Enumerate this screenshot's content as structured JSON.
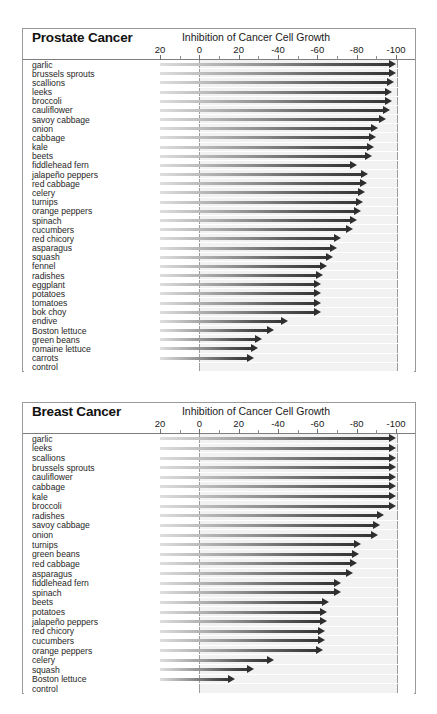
{
  "chart_data": [
    {
      "type": "bar",
      "title": "Prostate Cancer",
      "subtitle": "Inhibition of Cancer Cell Growth",
      "xlabel": "Inhibition of Cancer Cell Growth",
      "ylabel": "",
      "orientation": "horizontal",
      "grid": false,
      "legend": "none",
      "axis_ticks": [
        "20",
        "0",
        "20",
        "-40",
        "-60",
        "-80",
        "-100"
      ],
      "axis_tick_values": [
        20,
        0,
        -20,
        -40,
        -60,
        -80,
        -100
      ],
      "xlim": [
        20,
        -100
      ],
      "categories": [
        "garlic",
        "brussels sprouts",
        "scallions",
        "leeks",
        "broccoli",
        "cauliflower",
        "savoy cabbage",
        "onion",
        "cabbage",
        "kale",
        "beets",
        "fiddlehead fern",
        "jalapeño peppers",
        "red cabbage",
        "celery",
        "turnips",
        "orange peppers",
        "spinach",
        "cucumbers",
        "red chicory",
        "asparagus",
        "squash",
        "fennel",
        "radishes",
        "eggplant",
        "potatoes",
        "tomatoes",
        "bok choy",
        "endive",
        "Boston lettuce",
        "green beans",
        "romaine lettuce",
        "carrots",
        "control"
      ],
      "values": [
        -100,
        -100,
        -99,
        -98,
        -98,
        -97,
        -95,
        -91,
        -90,
        -89,
        -88,
        -80,
        -86,
        -85,
        -84,
        -83,
        -82,
        -80,
        -78,
        -72,
        -70,
        -68,
        -65,
        -63,
        -62,
        -62,
        -62,
        -62,
        -45,
        -38,
        -32,
        -30,
        -28,
        0
      ]
    },
    {
      "type": "bar",
      "title": "Breast Cancer",
      "subtitle": "Inhibition of Cancer Cell Growth",
      "xlabel": "Inhibition of Cancer Cell Growth",
      "ylabel": "",
      "orientation": "horizontal",
      "grid": false,
      "legend": "none",
      "axis_ticks": [
        "20",
        "0",
        "20",
        "-40",
        "-60",
        "-80",
        "-100"
      ],
      "axis_tick_values": [
        20,
        0,
        -20,
        -40,
        -60,
        -80,
        -100
      ],
      "xlim": [
        20,
        -100
      ],
      "categories": [
        "garlic",
        "leeks",
        "scallions",
        "brussels sprouts",
        "cauliflower",
        "cabbage",
        "kale",
        "broccoli",
        "radishes",
        "savoy cabbage",
        "onion",
        "turnips",
        "green beans",
        "red cabbage",
        "asparagus",
        "fiddlehead fern",
        "spinach",
        "beets",
        "potatoes",
        "jalapeño peppers",
        "red chicory",
        "cucumbers",
        "orange peppers",
        "celery",
        "squash",
        "Boston lettuce",
        "control"
      ],
      "values": [
        -100,
        -100,
        -100,
        -100,
        -100,
        -100,
        -100,
        -100,
        -94,
        -92,
        -91,
        -82,
        -81,
        -80,
        -78,
        -72,
        -72,
        -66,
        -65,
        -65,
        -64,
        -64,
        -63,
        -38,
        -28,
        -18,
        0
      ]
    }
  ],
  "panels": [
    {
      "id": "prostate",
      "title": "Prostate Cancer",
      "axis_title": "Inhibition of Cancer Cell Growth"
    },
    {
      "id": "breast",
      "title": "Breast Cancer",
      "axis_title": "Inhibition of Cancer Cell Growth"
    }
  ],
  "colors": {
    "bar_dark": "#2e2e2e",
    "bar_light": "#dedede",
    "plot_background": "#f2f2f2",
    "panel_border": "#9a9a9a",
    "text": "#1a1a1a"
  }
}
